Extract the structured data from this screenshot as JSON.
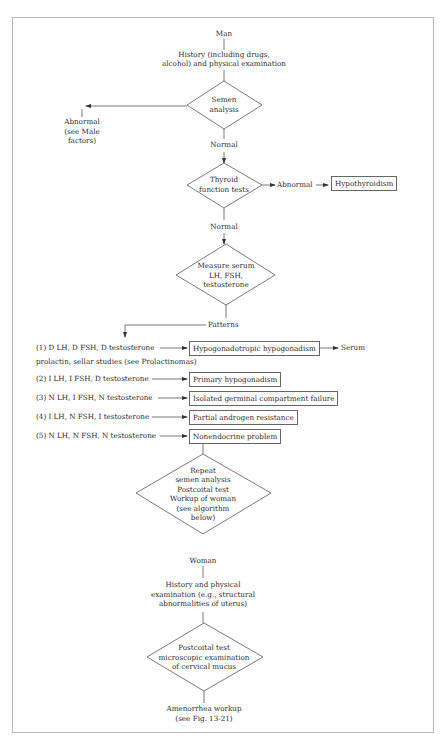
{
  "figure": {
    "man": {
      "start": "Man",
      "history": [
        "History (including drugs,",
        "alcohol) and physical examination"
      ],
      "semen_diamond": [
        "Semen",
        "analysis"
      ],
      "semen_abnormal": [
        "Abnormal",
        "(see Male",
        "factors)"
      ],
      "normal_1": "Normal",
      "thyroid_diamond": [
        "Thyroid",
        "function tests"
      ],
      "thyroid_abnormal": "Abnormal",
      "hypothyroidism_box": "Hypothyroidism",
      "normal_2": "Normal",
      "measure_diamond": [
        "Measure serum",
        "LH, FSH,",
        "testosterone"
      ],
      "patterns": "Patterns",
      "pattern_rows": [
        {
          "label": "(1) D LH, D FSH, D testosterone",
          "result": "Hypogonadotropic hypogonadism",
          "after": "Serum",
          "continuation": "prolactin, sellar studies (see Prolactinomas)"
        },
        {
          "label": "(2) I LH, I FSH, D testosterone",
          "result": "Primary hypogonadism"
        },
        {
          "label": "(3) N LH, I FSH, N testosterone",
          "result": "Isolated germinal compartment failure"
        },
        {
          "label": "(4) I LH, N FSH, I testosterone",
          "result": "Partial androgen resistance"
        },
        {
          "label": "(5) N LH, N FSH, N testosterone",
          "result": "Nonendocrine problem"
        }
      ],
      "repeat_diamond": [
        "Repeat",
        "semen analysis",
        "Postcoital test",
        "Workup of woman",
        "(see algorithm",
        "below)"
      ]
    },
    "woman": {
      "start": "Woman",
      "history": [
        "History and physical",
        "examination (e.g., structural",
        "abnormalities of uterus)"
      ],
      "postcoital_diamond": [
        "Postcoital test",
        "microscopic examination",
        "of cervical mucus"
      ],
      "outcome": [
        "Amenorrhea workup",
        "(see Fig. 13-21)"
      ]
    },
    "colors": {
      "line": "#555555",
      "frame": "#b5b5b5",
      "text": "#2b2b2b"
    }
  }
}
